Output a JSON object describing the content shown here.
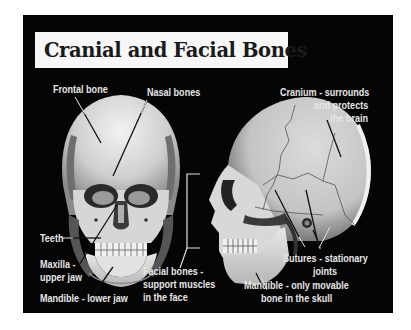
{
  "title": "Cranial and Facial Bones",
  "colors": {
    "background": "#050505",
    "title_box": "#f7f7f7",
    "title_text": "#1a1a1a",
    "label_text": "#e6e6e6",
    "bone": "#d9d9d9"
  },
  "figures": {
    "front_skull": {
      "labels": {
        "frontal_bone": "Frontal bone",
        "nasal_bones": "Nasal bones",
        "teeth": "Teeth",
        "maxilla_line1": "Maxilla -",
        "maxilla_line2": "upper jaw",
        "mandible": "Mandible - lower jaw"
      }
    },
    "side_skull": {
      "labels": {
        "cranium_line1": "Cranium - surrounds",
        "cranium_line2": "and protects",
        "cranium_line3": "the brain",
        "facial_line1": "Facial bones -",
        "facial_line2": "support muscles",
        "facial_line3": "in the face",
        "sutures_line1": "Sutures - stationary",
        "sutures_line2": "joints",
        "mandible_line1": "Mandible - only movable",
        "mandible_line2": "bone in the skull"
      }
    }
  }
}
